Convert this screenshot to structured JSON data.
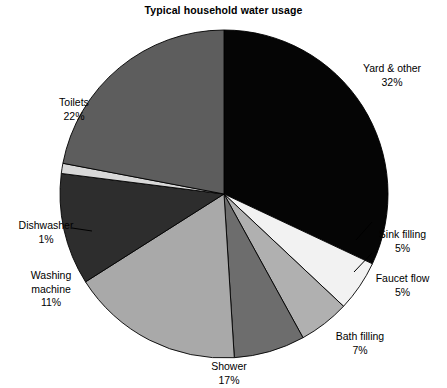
{
  "chart_data": {
    "type": "pie",
    "title": "Typical household water usage",
    "xlabel": "",
    "ylabel": "",
    "legend_position": "none",
    "grid": false,
    "units": "percent",
    "categories": [
      "Yard & other",
      "Sink filling",
      "Faucet flow",
      "Bath filling",
      "Shower",
      "Washing machine",
      "Dishwasher",
      "Toilets"
    ],
    "values": [
      32,
      5,
      5,
      7,
      17,
      11,
      1,
      22
    ],
    "slices": [
      {
        "label": "Yard & other",
        "value": 32,
        "value_text": "32%",
        "color": "#050505"
      },
      {
        "label": "Sink filling",
        "value": 5,
        "value_text": "5%",
        "color": "#f2f2f2"
      },
      {
        "label": "Faucet flow",
        "value": 5,
        "value_text": "5%",
        "color": "#b0b0b0"
      },
      {
        "label": "Bath filling",
        "value": 7,
        "value_text": "7%",
        "color": "#6d6d6d"
      },
      {
        "label": "Shower",
        "value": 17,
        "value_text": "17%",
        "color": "#a9a9a9"
      },
      {
        "label": "Washing machine",
        "value": 11,
        "value_text": "11%",
        "color": "#2d2d2d"
      },
      {
        "label": "Dishwasher",
        "value": 1,
        "value_text": "1%",
        "color": "#d8d8d8"
      },
      {
        "label": "Toilets",
        "value": 22,
        "value_text": "22%",
        "color": "#5d5d5d"
      }
    ],
    "labels": {
      "yard_other": {
        "name": "Yard & other",
        "pct": "32%"
      },
      "sink_filling": {
        "name": "Sink filling",
        "pct": "5%"
      },
      "faucet_flow": {
        "name": "Faucet flow",
        "pct": "5%"
      },
      "bath_filling": {
        "name": "Bath filling",
        "pct": "7%"
      },
      "shower": {
        "name": "Shower",
        "pct": "17%"
      },
      "washing_machine": {
        "name_line1": "Washing",
        "name_line2": "machine",
        "pct": "11%"
      },
      "dishwasher": {
        "name": "Dishwasher",
        "pct": "1%"
      },
      "toilets": {
        "name": "Toilets",
        "pct": "22%"
      }
    },
    "geometry": {
      "center_x": 224,
      "center_y": 194,
      "radius": 164,
      "start_angle_deg": 0,
      "direction": "clockwise"
    }
  }
}
